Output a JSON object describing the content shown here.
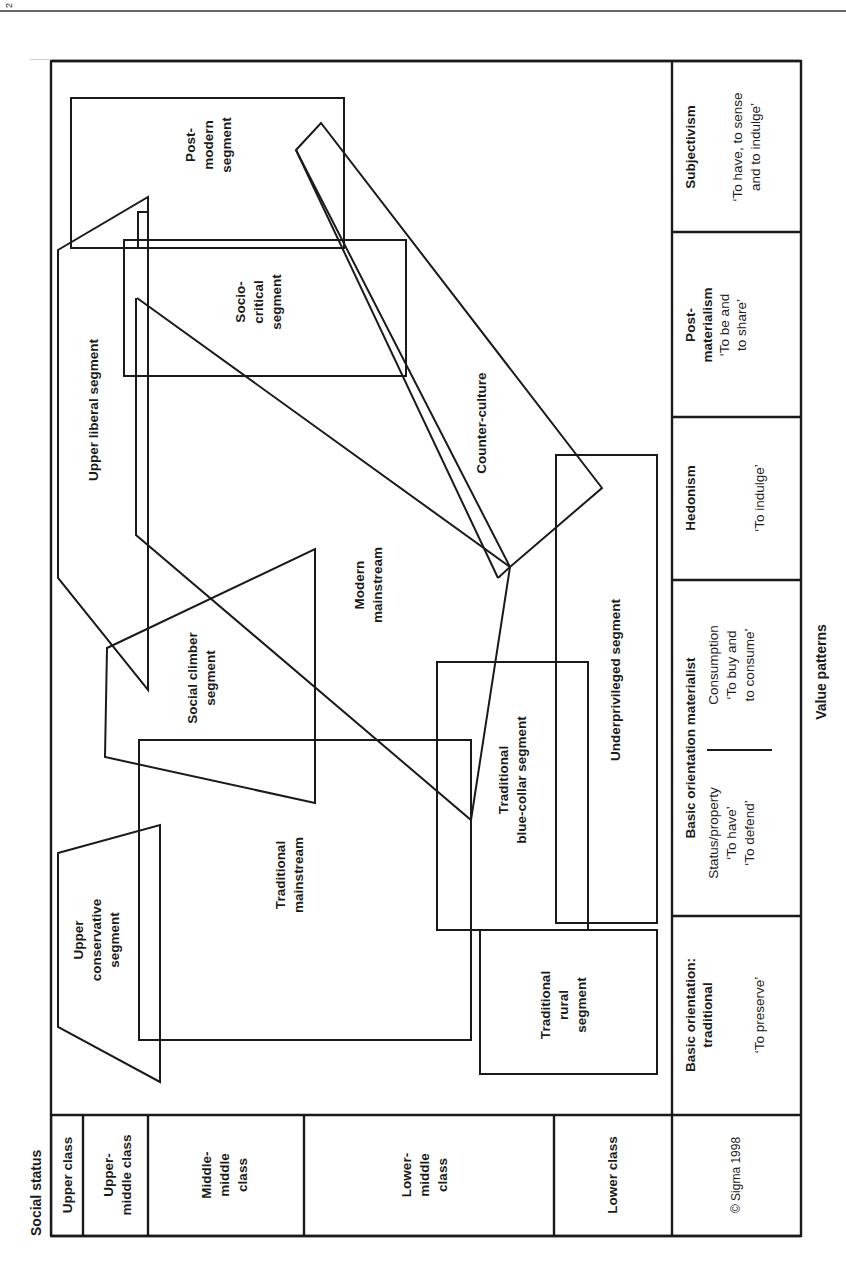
{
  "header": {
    "page_marker": "2"
  },
  "axes": {
    "y_title": "Social status",
    "x_title": "Value patterns"
  },
  "social_status": [
    {
      "label": "Upper class"
    },
    {
      "label": "Upper-\nmiddle class",
      "lines": [
        "Upper-",
        "middle class"
      ]
    },
    {
      "label": "Middle-middle class",
      "lines": [
        "Middle-",
        "middle",
        "class"
      ]
    },
    {
      "label": "Lower-middle class",
      "lines": [
        "Lower-",
        "middle",
        "class"
      ]
    },
    {
      "label": "Lower class"
    }
  ],
  "copyright": "© Sigma 1998",
  "value_patterns": [
    {
      "title_lines": [
        "Basic orientation:",
        "traditional"
      ],
      "sub_lines": [
        "‘To preserve’"
      ]
    },
    {
      "title_lines": [
        "Basic orientation materialist"
      ],
      "left_lines": [
        "Status/property",
        "‘To have’",
        "‘To defend’"
      ],
      "right_lines": [
        "Consumption",
        "‘To buy and",
        "to consume’"
      ]
    },
    {
      "title_lines": [
        "Hedonism"
      ],
      "sub_lines": [
        "‘To indulge’"
      ]
    },
    {
      "title_lines": [
        "Post-",
        "materialism"
      ],
      "sub_lines": [
        "‘To be and",
        "to share’"
      ]
    },
    {
      "title_lines": [
        "Subjectivism"
      ],
      "sub_lines": [
        "‘To have, to sense",
        "and to indulge’"
      ]
    }
  ],
  "segments": [
    {
      "id": "upper-conservative",
      "lines": [
        "Upper",
        "conservative",
        "segment"
      ]
    },
    {
      "id": "traditional-mainstream",
      "lines": [
        "Traditional",
        "mainstream"
      ]
    },
    {
      "id": "traditional-rural",
      "lines": [
        "Traditional",
        "rural",
        "segment"
      ]
    },
    {
      "id": "social-climber",
      "lines": [
        "Social climber",
        "segment"
      ]
    },
    {
      "id": "traditional-blue-collar",
      "lines": [
        "Traditional",
        "blue-collar segment"
      ]
    },
    {
      "id": "underprivileged",
      "lines": [
        "Underprivileged segment"
      ]
    },
    {
      "id": "modern-mainstream",
      "lines": [
        "Modern",
        "mainstream"
      ]
    },
    {
      "id": "upper-liberal",
      "lines": [
        "Upper liberal segment"
      ]
    },
    {
      "id": "counter-culture",
      "lines": [
        "Counter-culture"
      ]
    },
    {
      "id": "socio-critical",
      "lines": [
        "Socio-",
        "critical",
        "segment"
      ]
    },
    {
      "id": "post-modern",
      "lines": [
        "Post-",
        "modern",
        "segment"
      ]
    }
  ]
}
